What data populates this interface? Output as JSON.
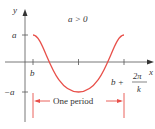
{
  "diagram": {
    "condition_label": "a > 0",
    "y_axis_label": "y",
    "x_axis_label": "x",
    "y_tick_pos_label": "a",
    "y_tick_neg_label": "−a",
    "x_start_label": "b",
    "x_end_label_prefix": "b +",
    "x_end_label_num": "2π",
    "x_end_label_den": "k",
    "period_label": "One period",
    "curve_color": "#e8504a",
    "bracket_color": "#e8504a",
    "axis_color": "#555555",
    "function": "y = a cos(k(x − b))"
  }
}
